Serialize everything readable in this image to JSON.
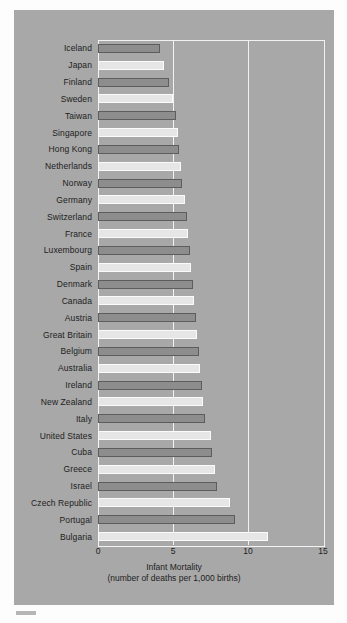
{
  "chart_data": {
    "type": "bar",
    "orientation": "horizontal",
    "title": "",
    "xlabel": "Infant Mortality",
    "xlabel_line2": "(number of deaths per 1,000 births)",
    "ylabel": "",
    "xlim": [
      0,
      15
    ],
    "xticks": [
      0,
      5,
      10,
      15
    ],
    "xtick_labels": [
      "0",
      "5",
      "10",
      "15"
    ],
    "grid": true,
    "gridline_values": [
      5,
      10
    ],
    "legend": "none",
    "categories": [
      "Iceland",
      "Japan",
      "Finland",
      "Sweden",
      "Taiwan",
      "Singapore",
      "Hong Kong",
      "Netherlands",
      "Norway",
      "Germany",
      "Switzerland",
      "France",
      "Luxembourg",
      "Spain",
      "Denmark",
      "Canada",
      "Austria",
      "Great Britain",
      "Belgium",
      "Australia",
      "Ireland",
      "New Zealand",
      "Italy",
      "United States",
      "Cuba",
      "Greece",
      "Israel",
      "Czech Republic",
      "Portugal",
      "Bulgaria"
    ],
    "values": [
      4.1,
      4.4,
      4.7,
      5.0,
      5.2,
      5.3,
      5.4,
      5.5,
      5.6,
      5.8,
      5.9,
      6.0,
      6.1,
      6.2,
      6.3,
      6.4,
      6.5,
      6.6,
      6.7,
      6.8,
      6.9,
      7.0,
      7.1,
      7.5,
      7.6,
      7.8,
      7.9,
      8.8,
      9.1,
      11.3
    ],
    "bar_colors": {
      "alternating": true,
      "dark_fill": "#8d8d8d",
      "dark_edge": "#5d5d5d",
      "light_fill": "#e6e6e6",
      "light_edge": "#fbfbfb"
    },
    "panel_background": "#a8a8a8",
    "axis_color": "#f2f2f2"
  }
}
